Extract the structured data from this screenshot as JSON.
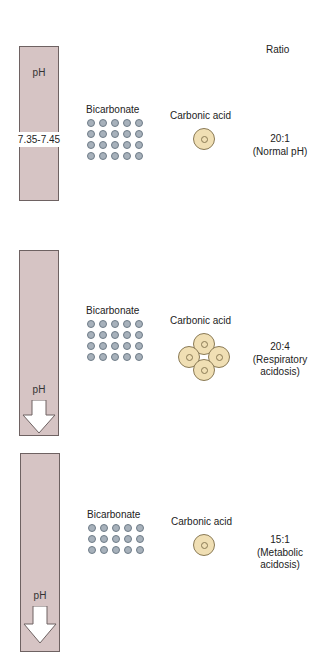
{
  "header": {
    "ratio_heading": "Ratio"
  },
  "colors": {
    "bar_fill": "#d6c4c4",
    "bar_border": "#6e6262",
    "bicarbonate_dot": "#a7b1bb",
    "carbonic_acid_fill": "#f0dfb4"
  },
  "sections": [
    {
      "bar_label": "pH",
      "ph_range": "7.35-7.45",
      "ph_arrow": "none",
      "bicarbonate_label": "Bicarbonate",
      "bicarbonate_count": 20,
      "carbonic_acid_label": "Carbonic acid",
      "carbonic_acid_count": 1,
      "ratio": "20:1",
      "condition": "(Normal pH)"
    },
    {
      "bar_label": "pH",
      "ph_arrow": "down",
      "bicarbonate_label": "Bicarbonate",
      "bicarbonate_count": 20,
      "carbonic_acid_label": "Carbonic acid",
      "carbonic_acid_count": 4,
      "ratio": "20:4",
      "condition_line1": "(Respiratory",
      "condition_line2": "acidosis)"
    },
    {
      "bar_label": "pH",
      "ph_arrow": "down",
      "bicarbonate_label": "Bicarbonate",
      "bicarbonate_count": 15,
      "carbonic_acid_label": "Carbonic acid",
      "carbonic_acid_count": 1,
      "ratio": "15:1",
      "condition_line1": "(Metabolic",
      "condition_line2": "acidosis)"
    }
  ]
}
